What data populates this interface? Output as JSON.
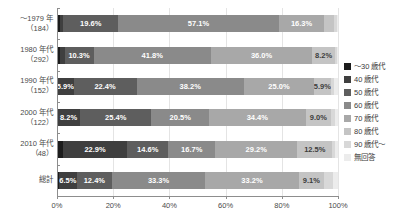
{
  "chart_data": {
    "type": "bar",
    "subtype": "horizontal-100-percent-stacked",
    "title": "",
    "xlabel": "",
    "ylabel": "",
    "xlim": [
      0,
      100
    ],
    "xticks": [
      "0%",
      "20%",
      "40%",
      "60%",
      "80%",
      "100%"
    ],
    "xtick_values": [
      0,
      20,
      40,
      60,
      80,
      100
    ],
    "grid": true,
    "legend_position": "right",
    "categories": [
      "～1979 年\n（184）",
      "1980 年代\n（292）",
      "1990 年代\n（152）",
      "2000 年代\n（122）",
      "2010 年代\n（48）",
      "総計"
    ],
    "series": [
      {
        "name": "～30 歳代",
        "color": "#1c1c1c",
        "values": [
          1.1,
          1.0,
          0.0,
          0.0,
          2.1,
          0.6
        ]
      },
      {
        "name": "40 歳代",
        "color": "#3f3f3f",
        "values": [
          1.1,
          1.7,
          5.9,
          8.2,
          22.9,
          6.5
        ]
      },
      {
        "name": "50 歳代",
        "color": "#5e5e5e",
        "values": [
          19.6,
          10.3,
          22.4,
          25.4,
          14.6,
          12.4
        ]
      },
      {
        "name": "60 歳代",
        "color": "#8a8a8a",
        "values": [
          57.1,
          41.8,
          38.2,
          20.5,
          16.7,
          33.3
        ]
      },
      {
        "name": "70 歳代",
        "color": "#a8a8a8",
        "values": [
          16.3,
          36.0,
          25.0,
          34.4,
          29.2,
          33.2
        ]
      },
      {
        "name": "80 歳代",
        "color": "#c4c4c4",
        "values": [
          3.3,
          8.2,
          5.9,
          9.0,
          12.5,
          9.1
        ]
      },
      {
        "name": "90 歳代～",
        "color": "#d8d8d8",
        "values": [
          1.1,
          0.7,
          1.3,
          1.6,
          1.0,
          3.3
        ]
      },
      {
        "name": "無回答",
        "color": "#ececec",
        "values": [
          0.4,
          0.3,
          1.3,
          0.9,
          1.0,
          1.6
        ]
      }
    ],
    "rows": [
      {
        "label_line1": "～1979 年",
        "label_line2": "（184）",
        "segments": [
          {
            "series": "～30 歳代",
            "value": 1.1,
            "label": "",
            "color": "#1c1c1c",
            "label_tone": "dark"
          },
          {
            "series": "40 歳代",
            "value": 1.1,
            "label": "",
            "color": "#3f3f3f",
            "label_tone": "dark"
          },
          {
            "series": "50 歳代",
            "value": 19.6,
            "label": "19.6%",
            "color": "#5e5e5e",
            "label_tone": "dark"
          },
          {
            "series": "60 歳代",
            "value": 57.1,
            "label": "57.1%",
            "color": "#8a8a8a",
            "label_tone": "dark"
          },
          {
            "series": "70 歳代",
            "value": 16.3,
            "label": "16.3%",
            "color": "#a8a8a8",
            "label_tone": "dark"
          },
          {
            "series": "80 歳代",
            "value": 3.3,
            "label": "",
            "color": "#c4c4c4",
            "label_tone": "light"
          },
          {
            "series": "90 歳代～",
            "value": 1.1,
            "label": "",
            "color": "#d8d8d8",
            "label_tone": "light"
          },
          {
            "series": "無回答",
            "value": 0.4,
            "label": "",
            "color": "#ececec",
            "label_tone": "light"
          }
        ]
      },
      {
        "label_line1": "1980 年代",
        "label_line2": "（292）",
        "segments": [
          {
            "series": "～30 歳代",
            "value": 1.0,
            "label": "",
            "color": "#1c1c1c",
            "label_tone": "dark"
          },
          {
            "series": "40 歳代",
            "value": 1.7,
            "label": "",
            "color": "#3f3f3f",
            "label_tone": "dark"
          },
          {
            "series": "50 歳代",
            "value": 10.3,
            "label": "10.3%",
            "color": "#5e5e5e",
            "label_tone": "dark"
          },
          {
            "series": "60 歳代",
            "value": 41.8,
            "label": "41.8%",
            "color": "#8a8a8a",
            "label_tone": "dark"
          },
          {
            "series": "70 歳代",
            "value": 36.0,
            "label": "36.0%",
            "color": "#a8a8a8",
            "label_tone": "dark"
          },
          {
            "series": "80 歳代",
            "value": 8.2,
            "label": "8.2%",
            "color": "#c4c4c4",
            "label_tone": "light"
          },
          {
            "series": "90 歳代～",
            "value": 0.7,
            "label": "",
            "color": "#d8d8d8",
            "label_tone": "light"
          },
          {
            "series": "無回答",
            "value": 0.3,
            "label": "",
            "color": "#ececec",
            "label_tone": "light"
          }
        ]
      },
      {
        "label_line1": "1990 年代",
        "label_line2": "（152）",
        "segments": [
          {
            "series": "40 歳代",
            "value": 5.9,
            "label": "5.9%",
            "color": "#3f3f3f",
            "label_tone": "dark"
          },
          {
            "series": "50 歳代",
            "value": 22.4,
            "label": "22.4%",
            "color": "#5e5e5e",
            "label_tone": "dark"
          },
          {
            "series": "60 歳代",
            "value": 38.2,
            "label": "38.2%",
            "color": "#8a8a8a",
            "label_tone": "dark"
          },
          {
            "series": "70 歳代",
            "value": 25.0,
            "label": "25.0%",
            "color": "#a8a8a8",
            "label_tone": "dark"
          },
          {
            "series": "80 歳代",
            "value": 5.9,
            "label": "5.9%",
            "color": "#c4c4c4",
            "label_tone": "light"
          },
          {
            "series": "90 歳代～",
            "value": 1.3,
            "label": "",
            "color": "#d8d8d8",
            "label_tone": "light"
          },
          {
            "series": "無回答",
            "value": 1.3,
            "label": "",
            "color": "#ececec",
            "label_tone": "light"
          }
        ]
      },
      {
        "label_line1": "2000 年代",
        "label_line2": "（122）",
        "segments": [
          {
            "series": "40 歳代",
            "value": 8.2,
            "label": "8.2%",
            "color": "#3f3f3f",
            "label_tone": "dark"
          },
          {
            "series": "50 歳代",
            "value": 25.4,
            "label": "25.4%",
            "color": "#5e5e5e",
            "label_tone": "dark"
          },
          {
            "series": "60 歳代",
            "value": 20.5,
            "label": "20.5%",
            "color": "#8a8a8a",
            "label_tone": "dark"
          },
          {
            "series": "70 歳代",
            "value": 34.4,
            "label": "34.4%",
            "color": "#a8a8a8",
            "label_tone": "dark"
          },
          {
            "series": "80 歳代",
            "value": 9.0,
            "label": "9.0%",
            "color": "#c4c4c4",
            "label_tone": "light"
          },
          {
            "series": "90 歳代～",
            "value": 1.6,
            "label": "",
            "color": "#d8d8d8",
            "label_tone": "light"
          },
          {
            "series": "無回答",
            "value": 0.9,
            "label": "",
            "color": "#ececec",
            "label_tone": "light"
          }
        ]
      },
      {
        "label_line1": "2010 年代",
        "label_line2": "（48）",
        "segments": [
          {
            "series": "～30 歳代",
            "value": 2.1,
            "label": "",
            "color": "#1c1c1c",
            "label_tone": "dark"
          },
          {
            "series": "40 歳代",
            "value": 22.9,
            "label": "22.9%",
            "color": "#3f3f3f",
            "label_tone": "dark"
          },
          {
            "series": "50 歳代",
            "value": 14.6,
            "label": "14.6%",
            "color": "#5e5e5e",
            "label_tone": "dark"
          },
          {
            "series": "60 歳代",
            "value": 16.7,
            "label": "16.7%",
            "color": "#8a8a8a",
            "label_tone": "dark"
          },
          {
            "series": "70 歳代",
            "value": 29.2,
            "label": "29.2%",
            "color": "#a8a8a8",
            "label_tone": "dark"
          },
          {
            "series": "80 歳代",
            "value": 12.5,
            "label": "12.5%",
            "color": "#c4c4c4",
            "label_tone": "light"
          },
          {
            "series": "90 歳代～",
            "value": 1.0,
            "label": "",
            "color": "#d8d8d8",
            "label_tone": "light"
          },
          {
            "series": "無回答",
            "value": 1.0,
            "label": "",
            "color": "#ececec",
            "label_tone": "light"
          }
        ]
      },
      {
        "label_line1": "総計",
        "label_line2": "",
        "segments": [
          {
            "series": "～30 歳代",
            "value": 0.6,
            "label": "",
            "color": "#1c1c1c",
            "label_tone": "dark"
          },
          {
            "series": "40 歳代",
            "value": 6.5,
            "label": "6.5%",
            "color": "#3f3f3f",
            "label_tone": "dark"
          },
          {
            "series": "50 歳代",
            "value": 12.4,
            "label": "12.4%",
            "color": "#5e5e5e",
            "label_tone": "dark"
          },
          {
            "series": "60 歳代",
            "value": 33.3,
            "label": "33.3%",
            "color": "#8a8a8a",
            "label_tone": "dark"
          },
          {
            "series": "70 歳代",
            "value": 33.2,
            "label": "33.2%",
            "color": "#a8a8a8",
            "label_tone": "dark"
          },
          {
            "series": "80 歳代",
            "value": 9.1,
            "label": "9.1%",
            "color": "#c4c4c4",
            "label_tone": "light"
          },
          {
            "series": "90 歳代～",
            "value": 3.3,
            "label": "",
            "color": "#d8d8d8",
            "label_tone": "light"
          },
          {
            "series": "無回答",
            "value": 1.6,
            "label": "",
            "color": "#ececec",
            "label_tone": "light"
          }
        ]
      }
    ],
    "legend": [
      {
        "label": "～30 歳代",
        "color": "#1c1c1c"
      },
      {
        "label": "40 歳代",
        "color": "#3f3f3f"
      },
      {
        "label": "50 歳代",
        "color": "#5e5e5e"
      },
      {
        "label": "60 歳代",
        "color": "#8a8a8a"
      },
      {
        "label": "70 歳代",
        "color": "#a8a8a8"
      },
      {
        "label": "80 歳代",
        "color": "#c4c4c4"
      },
      {
        "label": "90 歳代～",
        "color": "#d8d8d8"
      },
      {
        "label": "無回答",
        "color": "#ececec"
      }
    ]
  }
}
